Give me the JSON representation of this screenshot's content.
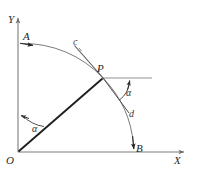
{
  "figure": {
    "kind": "geometry-diagram",
    "background_color": "#ffffff",
    "width": 200,
    "height": 181,
    "axes": {
      "x_label": "X",
      "y_label": "Y",
      "origin_label": "O",
      "axis_color": "#9a9a9a",
      "x_axis": {
        "x1": 18,
        "y1": 152,
        "x2": 188,
        "y2": 152
      },
      "y_axis": {
        "x1": 18,
        "y1": 152,
        "x2": 18,
        "y2": 14
      }
    },
    "points": {
      "O": {
        "label": "O",
        "x": 18,
        "y": 152
      },
      "A": {
        "label": "A",
        "x": 21,
        "y": 44
      },
      "P": {
        "label": "P",
        "x": 103,
        "y": 78
      },
      "B": {
        "label": "B",
        "x": 134,
        "y": 150
      }
    },
    "curves": {
      "arc_label_c": "c",
      "line_label_d": "d",
      "arc_color": "#555555",
      "radius_color": "#1f1f1f",
      "tangent_color": "#4a4a4a",
      "helper_color": "#8a8a8a"
    },
    "angles": [
      {
        "name": "angle-at-origin",
        "label": "α",
        "vertex": "O",
        "between": "Y-axis and OP"
      },
      {
        "name": "angle-at-p",
        "label": "α",
        "vertex": "P",
        "between": "d and horizontal"
      }
    ]
  }
}
